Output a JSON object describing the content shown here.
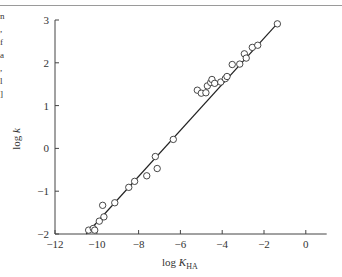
{
  "figure": {
    "caption_fragments": [
      "n",
      ",",
      "f",
      "a",
      ",",
      "l",
      "]"
    ]
  },
  "chart_data": {
    "type": "scatter",
    "title": "",
    "xlabel": "log K_HA",
    "xlabel_main": "log ",
    "xlabel_var": "K",
    "xlabel_sub": "HA",
    "ylabel": "log k",
    "ylabel_main": "log ",
    "ylabel_var": "k",
    "xlim": [
      -12,
      1
    ],
    "ylim": [
      -2,
      3
    ],
    "xticks": [
      -12,
      -10,
      -8,
      -6,
      -4,
      -2,
      0
    ],
    "xtick_labels": [
      "−12",
      "−10",
      "−8",
      "−6",
      "−4",
      "−2",
      "0"
    ],
    "yticks": [
      3,
      2,
      1,
      0,
      -1,
      -2
    ],
    "ytick_labels": [
      "3",
      "2",
      "1",
      "0",
      "−1",
      "−2"
    ],
    "grid": false,
    "legend": null,
    "marker": "open-circle",
    "series": [
      {
        "name": "data",
        "points": [
          [
            -10.39,
            -1.91
          ],
          [
            -10.17,
            -1.87
          ],
          [
            -10.1,
            -1.91
          ],
          [
            -9.88,
            -1.7
          ],
          [
            -9.66,
            -1.6
          ],
          [
            -9.72,
            -1.33
          ],
          [
            -9.14,
            -1.27
          ],
          [
            -8.47,
            -0.91
          ],
          [
            -8.19,
            -0.77
          ],
          [
            -7.61,
            -0.64
          ],
          [
            -7.2,
            -0.19
          ],
          [
            -7.11,
            -0.47
          ],
          [
            -6.34,
            0.21
          ],
          [
            -5.19,
            1.36
          ],
          [
            -5.0,
            1.29
          ],
          [
            -4.78,
            1.3
          ],
          [
            -4.71,
            1.46
          ],
          [
            -4.55,
            1.54
          ],
          [
            -4.49,
            1.61
          ],
          [
            -4.36,
            1.52
          ],
          [
            -4.07,
            1.55
          ],
          [
            -3.85,
            1.63
          ],
          [
            -3.77,
            1.68
          ],
          [
            -3.52,
            1.96
          ],
          [
            -3.16,
            1.97
          ],
          [
            -2.94,
            2.21
          ],
          [
            -2.85,
            2.11
          ],
          [
            -2.56,
            2.36
          ],
          [
            -2.3,
            2.41
          ],
          [
            -1.36,
            2.91
          ]
        ]
      }
    ],
    "fit_line": {
      "x": [
        -10.5,
        -1.3
      ],
      "y": [
        -2.0,
        2.95
      ]
    }
  }
}
